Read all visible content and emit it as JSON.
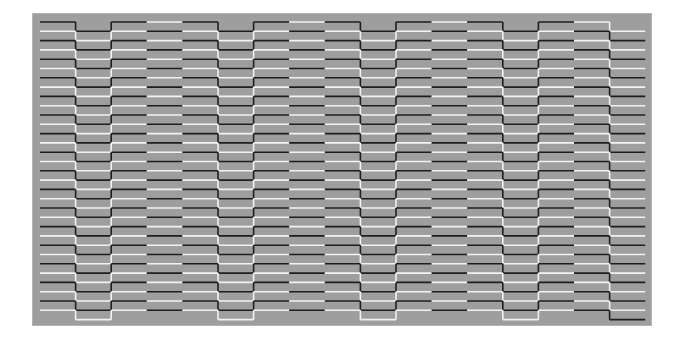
{
  "figure": {
    "colors": {
      "panel": "#9e9e9e",
      "dark_line": "#1e1e1e",
      "light_line": "#f2f2f2"
    },
    "line_count": 32,
    "columns": [
      {
        "first_color": "dark",
        "phase": "high"
      },
      {
        "first_color": "dark",
        "phase": "low"
      },
      {
        "first_color": "dark",
        "phase": "high"
      },
      {
        "first_color": "light",
        "phase": "high"
      },
      {
        "first_color": "dark",
        "phase": "high"
      },
      {
        "first_color": "dark",
        "phase": "low"
      },
      {
        "first_color": "dark",
        "phase": "high"
      },
      {
        "first_color": "light",
        "phase": "high"
      },
      {
        "first_color": "dark",
        "phase": "high"
      },
      {
        "first_color": "dark",
        "phase": "low"
      },
      {
        "first_color": "dark",
        "phase": "high"
      },
      {
        "first_color": "light",
        "phase": "high"
      },
      {
        "first_color": "dark",
        "phase": "high"
      },
      {
        "first_color": "dark",
        "phase": "low"
      },
      {
        "first_color": "dark",
        "phase": "high"
      },
      {
        "first_color": "light",
        "phase": "high"
      },
      {
        "first_color": "light",
        "phase": "low"
      }
    ]
  }
}
